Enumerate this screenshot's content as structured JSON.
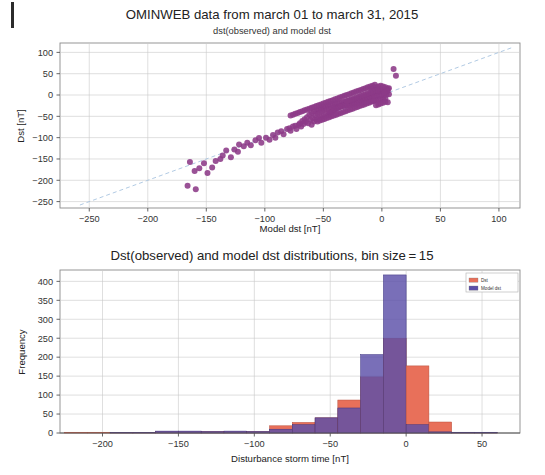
{
  "figure": {
    "panels": [
      "scatter-panel",
      "histogram-panel"
    ]
  },
  "chart_data": [
    {
      "type": "scatter",
      "title": "OMINWEB data from march 01 to march 31, 2015",
      "subtitle": "dst(observed) and model dst",
      "xlabel": "Model dst [nT]",
      "ylabel": "Dst [nT]",
      "xlim": [
        -275,
        118
      ],
      "ylim": [
        -265,
        122
      ],
      "xticks": [
        -250,
        -200,
        -150,
        -100,
        -50,
        0,
        50,
        100
      ],
      "xticklabels": [
        "−250",
        "−200",
        "−150",
        "−100",
        "−50",
        "0",
        "50",
        "100"
      ],
      "yticks": [
        100,
        50,
        0,
        -50,
        -100,
        -150,
        -200,
        -250
      ],
      "yticklabels": [
        "100",
        "50",
        "0",
        "−50",
        "−100",
        "−150",
        "−200",
        "−250"
      ],
      "grid": true,
      "marker_color": "#8c3a87",
      "marker_size": 3.0,
      "reference_line": {
        "label": "y = x",
        "style": "dashed",
        "color": "#a8c4e0",
        "from": [
          -258,
          -258
        ],
        "to": [
          112,
          112
        ]
      },
      "points": [
        [
          -166,
          -213
        ],
        [
          -159,
          -221
        ],
        [
          -164,
          -157
        ],
        [
          -160,
          -178
        ],
        [
          -156,
          -172
        ],
        [
          -152,
          -160
        ],
        [
          -149,
          -183
        ],
        [
          -145,
          -170
        ],
        [
          -142,
          -155
        ],
        [
          -138,
          -150
        ],
        [
          -136,
          -142
        ],
        [
          -133,
          -130
        ],
        [
          -129,
          -146
        ],
        [
          -126,
          -128
        ],
        [
          -123,
          -133
        ],
        [
          -122,
          -116
        ],
        [
          -118,
          -120
        ],
        [
          -115,
          -112
        ],
        [
          -112,
          -118
        ],
        [
          -108,
          -106
        ],
        [
          -105,
          -101
        ],
        [
          -103,
          -112
        ],
        [
          -99,
          -100
        ],
        [
          -96,
          -105
        ],
        [
          -93,
          -94
        ],
        [
          -91,
          -100
        ],
        [
          -89,
          -88
        ],
        [
          -86,
          -85
        ],
        [
          -84,
          -92
        ],
        [
          -81,
          -80
        ],
        [
          -79,
          -78
        ],
        [
          -78,
          -84
        ],
        [
          -76,
          -74
        ],
        [
          -74,
          -72
        ],
        [
          -73,
          -80
        ],
        [
          -71,
          -70
        ],
        [
          -70,
          -66
        ],
        [
          -69,
          -74
        ],
        [
          -68,
          -61
        ],
        [
          -67,
          -68
        ],
        [
          -66,
          -57
        ],
        [
          -65,
          -63
        ],
        [
          -64,
          -52
        ],
        [
          -63,
          -66
        ],
        [
          -62,
          -46
        ],
        [
          -61,
          -58
        ],
        [
          -60,
          -42
        ],
        [
          -60,
          -70
        ],
        [
          -59,
          -54
        ],
        [
          -58,
          -38
        ],
        [
          -58,
          -62
        ],
        [
          -57,
          -48
        ],
        [
          -56,
          -35
        ],
        [
          -56,
          -58
        ],
        [
          -55,
          -44
        ],
        [
          -54,
          -33
        ],
        [
          -54,
          -55
        ],
        [
          -53,
          -41
        ],
        [
          -52,
          -30
        ],
        [
          -52,
          -52
        ],
        [
          -51,
          -38
        ],
        [
          -50,
          -28
        ],
        [
          -50,
          -50
        ],
        [
          -49,
          -36
        ],
        [
          -48,
          -26
        ],
        [
          -48,
          -48
        ],
        [
          -47,
          -34
        ],
        [
          -46,
          -24
        ],
        [
          -46,
          -46
        ],
        [
          -45,
          -33
        ],
        [
          -45,
          -44
        ],
        [
          -44,
          -22
        ],
        [
          -44,
          -42
        ],
        [
          -43,
          -31
        ],
        [
          -43,
          -40
        ],
        [
          -42,
          -21
        ],
        [
          -42,
          -38
        ],
        [
          -41,
          -30
        ],
        [
          -41,
          -36
        ],
        [
          -40,
          -20
        ],
        [
          -40,
          -34
        ],
        [
          -39,
          -28
        ],
        [
          -39,
          -32
        ],
        [
          -38,
          -19
        ],
        [
          -38,
          -30
        ],
        [
          -37,
          -27
        ],
        [
          -37,
          -29
        ],
        [
          -36,
          -18
        ],
        [
          -36,
          -28
        ],
        [
          -35,
          -26
        ],
        [
          -35,
          -27
        ],
        [
          -34,
          -17
        ],
        [
          -34,
          -25
        ],
        [
          -33,
          -24
        ],
        [
          -33,
          -26
        ],
        [
          -32,
          -16
        ],
        [
          -32,
          -23
        ],
        [
          -31,
          -22
        ],
        [
          -31,
          -25
        ],
        [
          -30,
          -15
        ],
        [
          -30,
          -21
        ],
        [
          -29,
          -20
        ],
        [
          -29,
          -24
        ],
        [
          -28,
          -14
        ],
        [
          -28,
          -19
        ],
        [
          -27,
          -18
        ],
        [
          -27,
          -23
        ],
        [
          -26,
          -13
        ],
        [
          -26,
          -17
        ],
        [
          -25,
          -16
        ],
        [
          -25,
          -22
        ],
        [
          -24,
          -12
        ],
        [
          -24,
          -15
        ],
        [
          -23,
          -14
        ],
        [
          -23,
          -21
        ],
        [
          -22,
          -11
        ],
        [
          -22,
          -13
        ],
        [
          -21,
          -12
        ],
        [
          -21,
          -20
        ],
        [
          -20,
          -10
        ],
        [
          -20,
          -11
        ],
        [
          -19,
          -9
        ],
        [
          -19,
          -19
        ],
        [
          -18,
          -8
        ],
        [
          -18,
          -10
        ],
        [
          -17,
          -7
        ],
        [
          -17,
          -18
        ],
        [
          -16,
          -6
        ],
        [
          -16,
          -9
        ],
        [
          -15,
          -5
        ],
        [
          -15,
          -17
        ],
        [
          -14,
          -4
        ],
        [
          -14,
          -8
        ],
        [
          -13,
          -3
        ],
        [
          -13,
          -16
        ],
        [
          -12,
          -2
        ],
        [
          -12,
          -7
        ],
        [
          -11,
          -1
        ],
        [
          -11,
          -15
        ],
        [
          -10,
          0
        ],
        [
          -10,
          -6
        ],
        [
          -9,
          1
        ],
        [
          -9,
          -14
        ],
        [
          -8,
          2
        ],
        [
          -8,
          -5
        ],
        [
          -7,
          3
        ],
        [
          -7,
          -13
        ],
        [
          -6,
          4
        ],
        [
          -6,
          -4
        ],
        [
          -5,
          5
        ],
        [
          -5,
          -12
        ],
        [
          -4,
          6
        ],
        [
          -4,
          -3
        ],
        [
          -3,
          7
        ],
        [
          -3,
          -11
        ],
        [
          -2,
          8
        ],
        [
          -2,
          -2
        ],
        [
          -1,
          9
        ],
        [
          -1,
          -10
        ],
        [
          0,
          10
        ],
        [
          0,
          -1
        ],
        [
          1,
          11
        ],
        [
          1,
          -9
        ],
        [
          2,
          12
        ],
        [
          2,
          0
        ],
        [
          3,
          13
        ],
        [
          3,
          -8
        ],
        [
          4,
          14
        ],
        [
          4,
          1
        ],
        [
          5,
          15
        ],
        [
          5,
          -17
        ],
        [
          6,
          16
        ],
        [
          6,
          2
        ],
        [
          -12,
          18
        ],
        [
          -10,
          20
        ],
        [
          -8,
          22
        ],
        [
          -6,
          24
        ],
        [
          -14,
          16
        ],
        [
          -16,
          14
        ],
        [
          -18,
          12
        ],
        [
          -20,
          10
        ],
        [
          -22,
          8
        ],
        [
          -24,
          6
        ],
        [
          -26,
          4
        ],
        [
          -28,
          2
        ],
        [
          -30,
          0
        ],
        [
          -32,
          -2
        ],
        [
          -34,
          -4
        ],
        [
          -36,
          -6
        ],
        [
          -38,
          -8
        ],
        [
          -40,
          -10
        ],
        [
          -42,
          -12
        ],
        [
          -44,
          -14
        ],
        [
          -46,
          -16
        ],
        [
          -48,
          -18
        ],
        [
          -50,
          -20
        ],
        [
          -52,
          -22
        ],
        [
          -54,
          -24
        ],
        [
          -56,
          -26
        ],
        [
          -58,
          -28
        ],
        [
          -60,
          -30
        ],
        [
          -62,
          -32
        ],
        [
          -64,
          -34
        ],
        [
          -66,
          -36
        ],
        [
          -68,
          -38
        ],
        [
          -70,
          -40
        ],
        [
          -72,
          -42
        ],
        [
          -74,
          -44
        ],
        [
          -76,
          -46
        ],
        [
          -78,
          -48
        ],
        [
          -55,
          -62
        ],
        [
          -53,
          -60
        ],
        [
          -51,
          -58
        ],
        [
          -49,
          -56
        ],
        [
          -47,
          -54
        ],
        [
          -45,
          -52
        ],
        [
          -43,
          -50
        ],
        [
          -41,
          -48
        ],
        [
          -39,
          -46
        ],
        [
          -37,
          -44
        ],
        [
          -35,
          -42
        ],
        [
          -33,
          -40
        ],
        [
          -31,
          -38
        ],
        [
          -29,
          -36
        ],
        [
          -27,
          -34
        ],
        [
          -25,
          -32
        ],
        [
          -23,
          -30
        ],
        [
          -21,
          -28
        ],
        [
          -19,
          -26
        ],
        [
          -17,
          -24
        ],
        [
          -15,
          -22
        ],
        [
          -13,
          -20
        ],
        [
          -11,
          -18
        ],
        [
          -9,
          -16
        ],
        [
          -7,
          -14
        ],
        [
          -5,
          -24
        ],
        [
          -3,
          -22
        ],
        [
          -1,
          -20
        ],
        [
          1,
          -18
        ],
        [
          3,
          -16
        ],
        [
          -9,
          14
        ],
        [
          -7,
          16
        ],
        [
          -5,
          18
        ],
        [
          -3,
          20
        ],
        [
          -1,
          22
        ],
        [
          1,
          20
        ],
        [
          3,
          18
        ],
        [
          5,
          10
        ],
        [
          4,
          8
        ],
        [
          2,
          6
        ],
        [
          -2,
          14
        ],
        [
          -4,
          12
        ],
        [
          -6,
          10
        ],
        [
          -8,
          8
        ],
        [
          -10,
          6
        ],
        [
          -12,
          4
        ],
        [
          -14,
          2
        ],
        [
          -16,
          0
        ],
        [
          -18,
          -2
        ],
        [
          -20,
          -4
        ],
        [
          -22,
          -6
        ],
        [
          -24,
          -8
        ],
        [
          -26,
          -10
        ],
        [
          -28,
          -12
        ],
        [
          -30,
          -14
        ],
        [
          10,
          61
        ],
        [
          12,
          45
        ]
      ]
    },
    {
      "type": "bar",
      "subtype": "histogram-overlay",
      "title": "Dst(observed) and model dst distributions, bin size = 15",
      "xlabel": "Disturbance storm time [nT]",
      "ylabel": "Frequency",
      "bin_size": 15,
      "xlim": [
        -228,
        75
      ],
      "ylim": [
        0,
        430
      ],
      "xticks": [
        -200,
        -150,
        -100,
        -50,
        0,
        50
      ],
      "xticklabels": [
        "−200",
        "−150",
        "−100",
        "−50",
        "0",
        "50"
      ],
      "yticks": [
        0,
        50,
        100,
        150,
        200,
        250,
        300,
        350,
        400
      ],
      "yticklabels": [
        "0",
        "50",
        "100",
        "150",
        "200",
        "250",
        "300",
        "350",
        "400"
      ],
      "grid": true,
      "bin_edges": [
        -225,
        -210,
        -195,
        -180,
        -165,
        -150,
        -135,
        -120,
        -105,
        -90,
        -75,
        -60,
        -45,
        -30,
        -15,
        0,
        15,
        30,
        45,
        60
      ],
      "legend": {
        "position": "top-right",
        "entries": [
          {
            "label": "Dst",
            "color": "#e8705a"
          },
          {
            "label": "Model dst",
            "color": "#5b4fa8"
          }
        ]
      },
      "series": [
        {
          "name": "Dst",
          "color": "#e8705a",
          "values": [
            2,
            2,
            1,
            1,
            4,
            4,
            4,
            4,
            4,
            19,
            28,
            40,
            87,
            148,
            250,
            177,
            29,
            2,
            1
          ]
        },
        {
          "name": "Model dst",
          "color": "#5b4fa8",
          "values": [
            0,
            0,
            1,
            1,
            5,
            5,
            4,
            5,
            4,
            10,
            22,
            40,
            66,
            207,
            417,
            22,
            3,
            2,
            2
          ]
        }
      ],
      "overlap_color": "#6b3f8f"
    }
  ]
}
